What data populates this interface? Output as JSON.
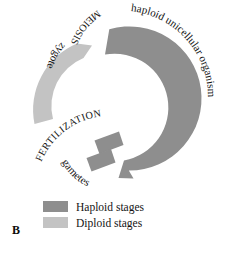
{
  "figure": {
    "panel_letter": "B",
    "diagram_type": "haploid-diploid-life-cycle-ring",
    "colors": {
      "haploid": "#8e8e8e",
      "diploid": "#c3c3c3",
      "text": "#141414",
      "background": "#ffffff"
    },
    "stages": [
      {
        "id": "haploid-unicellular-organism",
        "label": "haploid unicellular organism",
        "ploidy": "haploid",
        "color": "#8e8e8e",
        "orientation": "curved-outer-right",
        "arc_start_deg": -80,
        "arc_end_deg": 105
      },
      {
        "id": "meiosis",
        "label": "MEIOSIS",
        "ploidy": "transition",
        "orientation": "curved-upper-left",
        "style": "uppercase"
      },
      {
        "id": "zygote",
        "label": "zygote",
        "ploidy": "diploid",
        "color": "#c3c3c3",
        "orientation": "curved-left",
        "arc_start_deg": 150,
        "arc_end_deg": 218
      },
      {
        "id": "fertilization",
        "label": "FERTILIZATION",
        "ploidy": "transition",
        "orientation": "curved-lower-left",
        "style": "uppercase"
      },
      {
        "id": "gametes",
        "label": "gametes",
        "ploidy": "haploid",
        "color": "#8e8e8e",
        "orientation": "curved-lower-left",
        "segment_count": 2
      }
    ],
    "legend": {
      "items": [
        {
          "label": "Haploid stages",
          "color": "#8e8e8e"
        },
        {
          "label": "Diploid stages",
          "color": "#c3c3c3"
        }
      ]
    }
  }
}
